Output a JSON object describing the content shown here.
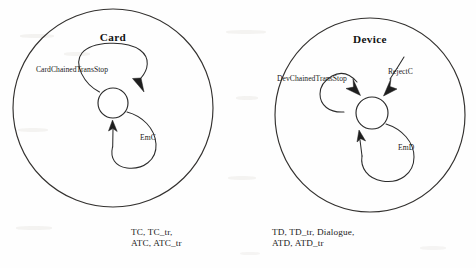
{
  "figure": {
    "kind": "state-machine-diagram",
    "background_color": "#fefefe",
    "ink_color": "#2b2b2b"
  },
  "components": [
    {
      "id": "card",
      "title": "Card",
      "envelope": {
        "cx": 113,
        "cy": 108,
        "rx": 100,
        "ry": 99
      },
      "state": {
        "cx": 113,
        "cy": 103,
        "r": 15
      },
      "transitions": [
        {
          "id": "card-chained-trans-stop",
          "label": "CardChainedTransStop"
        },
        {
          "id": "card-emc",
          "label": "EmC"
        }
      ],
      "gates": "TC, TC_tr,\nATC, ATC_tr",
      "gate_lines": [
        "TC, TC_tr,",
        "ATC, ATC_tr"
      ]
    },
    {
      "id": "device",
      "title": "Device",
      "envelope": {
        "cx": 370,
        "cy": 115,
        "rx": 95,
        "ry": 97
      },
      "state": {
        "cx": 372,
        "cy": 113,
        "r": 16
      },
      "transitions": [
        {
          "id": "dev-chained-trans-stop",
          "label": "DevChainedTransStop"
        },
        {
          "id": "dev-rejectc",
          "label": "RejectC"
        },
        {
          "id": "dev-emd",
          "label": "EmD"
        }
      ],
      "gates": "TD, TD_tr, Dialogue,\nATD, ATD_tr",
      "gate_lines": [
        "TD, TD_tr, Dialogue,",
        "ATD, ATD_tr"
      ]
    }
  ],
  "labels": {
    "card_title": "Card",
    "device_title": "Device",
    "card_chained_trans_stop": "CardChainedTransStop",
    "dev_chained_trans_stop": "DevChainedTransStop",
    "reject_c": "RejectC",
    "em_c": "EmC",
    "em_d": "EmD",
    "card_gates_line1": "TC, TC_tr,",
    "card_gates_line2": "ATC, ATC_tr",
    "device_gates_line1": "TD, TD_tr, Dialogue,",
    "device_gates_line2": "ATD, ATD_tr"
  }
}
